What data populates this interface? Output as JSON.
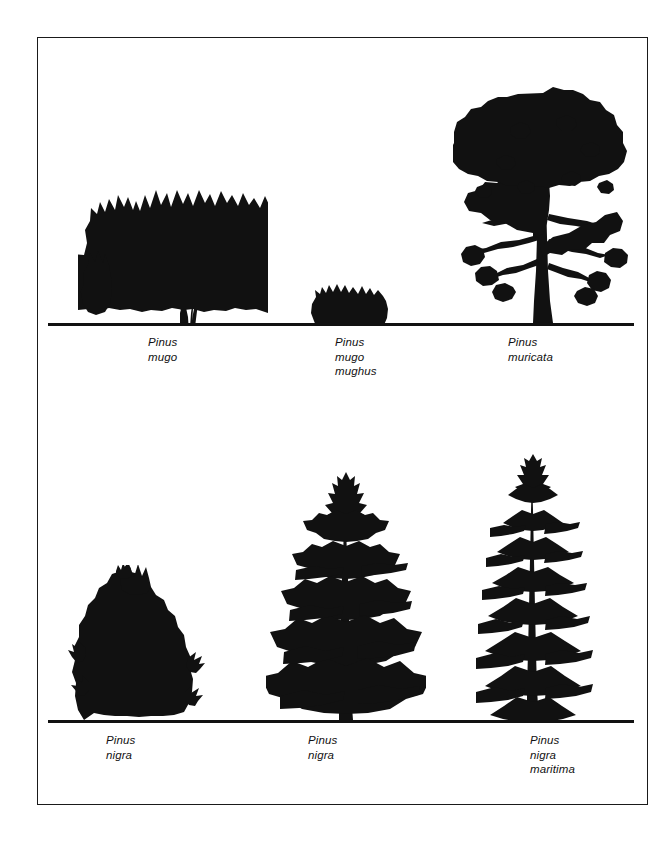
{
  "plate": {
    "title": "Pine tree silhouette comparison plate",
    "background_color": "#ffffff",
    "ink_color": "#111111",
    "frame": {
      "style": "thin black rectangle"
    },
    "rows": [
      {
        "name": "top-row",
        "ground_line": "horizontal baseline rule",
        "specimens": [
          {
            "id": "pinus-mugo",
            "habit": "broad spreading multi-stemmed small tree",
            "label_lines": [
              "Pinus",
              "mugo"
            ]
          },
          {
            "id": "pinus-mugo-mughus",
            "habit": "low dense rounded cushion shrub",
            "label_lines": [
              "Pinus",
              "mugo",
              "mughus"
            ]
          },
          {
            "id": "pinus-muricata",
            "habit": "tall straight-trunked tree with broad rounded crown",
            "label_lines": [
              "Pinus",
              "muricata"
            ]
          }
        ]
      },
      {
        "name": "bottom-row",
        "ground_line": "horizontal baseline rule",
        "specimens": [
          {
            "id": "pinus-nigra-bush",
            "habit": "dense bushy dome reaching the ground",
            "label_lines": [
              "Pinus",
              "nigra"
            ]
          },
          {
            "id": "pinus-nigra-tree",
            "habit": "conical tree with tiered whorled branches",
            "label_lines": [
              "Pinus",
              "nigra"
            ]
          },
          {
            "id": "pinus-nigra-maritima",
            "habit": "narrow columnar tree with horizontal branch tiers",
            "label_lines": [
              "Pinus",
              "nigra",
              "maritima"
            ]
          }
        ]
      }
    ]
  }
}
